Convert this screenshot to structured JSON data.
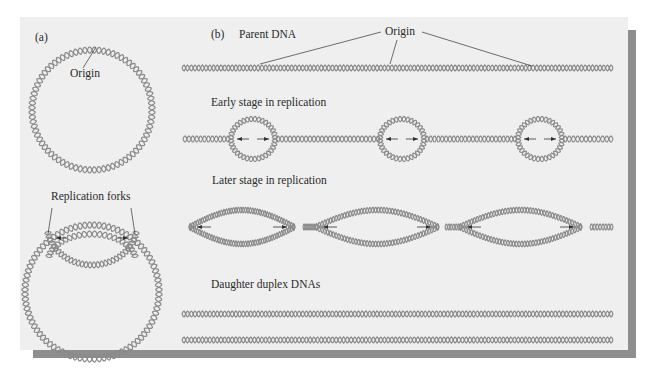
{
  "figure": {
    "panel_a": {
      "label": "(a)",
      "origin_label": "Origin",
      "forks_label": "Replication forks"
    },
    "panel_b": {
      "label": "(b)",
      "rows": [
        {
          "title": "Parent DNA",
          "annotation": "Origin",
          "origin_count": 3
        },
        {
          "title": "Early stage in replication",
          "bubble_count": 3
        },
        {
          "title": "Later stage in replication",
          "bubble_count": 3
        },
        {
          "title": "Daughter duplex DNAs",
          "duplex_count": 2
        }
      ]
    },
    "colors": {
      "panel_bg": "#efefef",
      "shadow": "#8e8e8e",
      "helix": "#8a8a8a",
      "text": "#2a2a2a"
    }
  }
}
